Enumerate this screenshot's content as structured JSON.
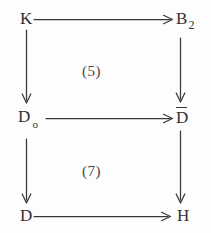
{
  "diagram": {
    "type": "commutative-diagram",
    "nodes": [
      {
        "id": "K",
        "label": "K",
        "base": "K",
        "sub": "",
        "overline": false,
        "position": "top-left"
      },
      {
        "id": "B2",
        "label": "B2",
        "base": "B",
        "sub": "2",
        "overline": false,
        "position": "top-right"
      },
      {
        "id": "D0",
        "label": "Do",
        "base": "D",
        "sub": "o",
        "overline": false,
        "position": "middle-left"
      },
      {
        "id": "Dbar",
        "label": "D",
        "base": "D",
        "sub": "",
        "overline": true,
        "position": "middle-right"
      },
      {
        "id": "D",
        "label": "D",
        "base": "D",
        "sub": "",
        "overline": false,
        "position": "bottom-left"
      },
      {
        "id": "H",
        "label": "H",
        "base": "H",
        "sub": "",
        "overline": false,
        "position": "bottom-right"
      }
    ],
    "square_labels": [
      {
        "id": "upper-square",
        "text": "(5)"
      },
      {
        "id": "lower-square",
        "text": "(7)"
      }
    ],
    "arrows": [
      {
        "id": "k-to-b2",
        "from": "K",
        "to": "B2",
        "direction": "right"
      },
      {
        "id": "d0-to-dbar",
        "from": "Do",
        "to": "D",
        "direction": "right"
      },
      {
        "id": "d-to-h",
        "from": "D",
        "to": "H",
        "direction": "right"
      },
      {
        "id": "k-to-d0",
        "from": "K",
        "to": "Do",
        "direction": "down"
      },
      {
        "id": "b2-to-dbar",
        "from": "B2",
        "to": "D",
        "direction": "down"
      },
      {
        "id": "d0-to-d",
        "from": "Do",
        "to": "D",
        "direction": "down"
      },
      {
        "id": "dbar-to-h",
        "from": "D",
        "to": "H",
        "direction": "down"
      }
    ],
    "colors": {
      "background": "#fdfdfd",
      "ink": "#333030",
      "stroke": "#3a3737"
    }
  }
}
